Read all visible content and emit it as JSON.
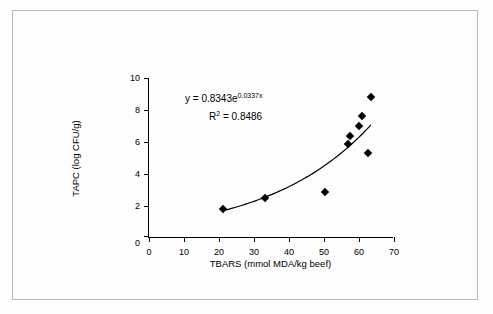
{
  "chart_data": {
    "type": "scatter",
    "title": "",
    "xlabel": "TBARS (mmol MDA/kg beef)",
    "ylabel": "TAPC (log CFU/g)",
    "xlim": [
      0,
      70
    ],
    "ylim": [
      0,
      10
    ],
    "xticks": [
      0,
      10,
      20,
      30,
      40,
      50,
      60,
      70
    ],
    "yticks": [
      0,
      2,
      4,
      6,
      8,
      10
    ],
    "grid": false,
    "legend": false,
    "points": [
      {
        "x": 21.0,
        "y": 1.8
      },
      {
        "x": 33.0,
        "y": 2.5
      },
      {
        "x": 50.3,
        "y": 2.9
      },
      {
        "x": 56.8,
        "y": 5.9
      },
      {
        "x": 57.5,
        "y": 6.4
      },
      {
        "x": 60.0,
        "y": 7.0
      },
      {
        "x": 60.8,
        "y": 7.6
      },
      {
        "x": 62.5,
        "y": 5.3
      },
      {
        "x": 63.4,
        "y": 8.8
      }
    ],
    "fit": {
      "model": "exponential",
      "a": 0.8343,
      "b": 0.0337,
      "equation_prefix": "y = 0.8343e",
      "equation_exponent": "0.0337x",
      "r2_label": "R",
      "r2_exponent": "2",
      "r2_value": " = 0.8486"
    }
  }
}
